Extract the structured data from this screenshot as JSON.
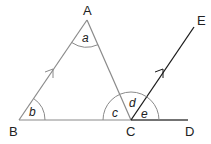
{
  "diagram": {
    "type": "geometry",
    "points": {
      "A": {
        "label": "A",
        "x": 87,
        "y": 20
      },
      "B": {
        "label": "B",
        "x": 19,
        "y": 120
      },
      "C": {
        "label": "C",
        "x": 131,
        "y": 120
      },
      "D": {
        "label": "D",
        "x": 188,
        "y": 120
      },
      "E": {
        "label": "E",
        "x": 194,
        "y": 27
      }
    },
    "angles": {
      "a": {
        "label": "a",
        "vertex": "A"
      },
      "b": {
        "label": "b",
        "vertex": "B"
      },
      "c": {
        "label": "c",
        "vertex": "C",
        "between": "CA and CB"
      },
      "d": {
        "label": "d",
        "vertex": "C",
        "between": "CA and CE"
      },
      "e": {
        "label": "e",
        "vertex": "C",
        "between": "CE and CD"
      }
    },
    "parallel_marks": [
      "BA",
      "CE"
    ],
    "colors": {
      "triangle_line": "#8a8a8a",
      "ray_line": "#1a1a1a",
      "text": "#222222"
    }
  }
}
